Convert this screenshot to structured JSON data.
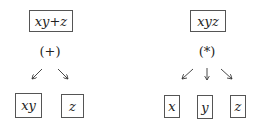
{
  "trees": [
    {
      "root": "xy+z",
      "operator": "(+)",
      "children": [
        "xy",
        "z"
      ]
    },
    {
      "root": "xyz",
      "operator": "(*)",
      "children": [
        "x",
        "y",
        "z"
      ]
    }
  ]
}
